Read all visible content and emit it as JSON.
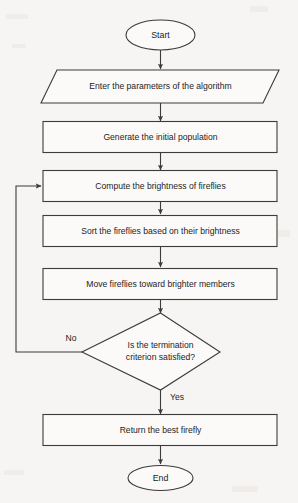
{
  "diagram": {
    "type": "flowchart",
    "background_color": "#f7f5f3",
    "line_color": "#3b3b3b",
    "shape_fill_color": "#fbfaf8",
    "text_color": "#1d1d1d",
    "nodes": [
      {
        "id": "start",
        "shape": "terminator",
        "label": "Start"
      },
      {
        "id": "input",
        "shape": "parallelogram",
        "label": "Enter the parameters of the algorithm"
      },
      {
        "id": "generate",
        "shape": "process",
        "label": "Generate the initial population"
      },
      {
        "id": "compute",
        "shape": "process",
        "label": "Compute the brightness of fireflies"
      },
      {
        "id": "sort",
        "shape": "process",
        "label": "Sort the fireflies based on their brightness"
      },
      {
        "id": "move",
        "shape": "process",
        "label": "Move fireflies toward brighter members"
      },
      {
        "id": "decision",
        "shape": "diamond",
        "label_line1": "Is the termination",
        "label_line2": "criterion satisfied?"
      },
      {
        "id": "return",
        "shape": "process",
        "label": "Return the best firefly"
      },
      {
        "id": "end",
        "shape": "terminator",
        "label": "End"
      }
    ],
    "edges": [
      {
        "from": "start",
        "to": "input",
        "label": ""
      },
      {
        "from": "input",
        "to": "generate",
        "label": ""
      },
      {
        "from": "generate",
        "to": "compute",
        "label": ""
      },
      {
        "from": "compute",
        "to": "sort",
        "label": ""
      },
      {
        "from": "sort",
        "to": "move",
        "label": ""
      },
      {
        "from": "move",
        "to": "decision",
        "label": ""
      },
      {
        "from": "decision",
        "to": "compute",
        "label": "No"
      },
      {
        "from": "decision",
        "to": "return",
        "label": "Yes"
      },
      {
        "from": "return",
        "to": "end",
        "label": ""
      }
    ],
    "branch_labels": {
      "no": "No",
      "yes": "Yes"
    }
  }
}
